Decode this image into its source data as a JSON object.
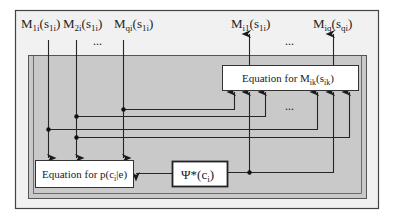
{
  "diagram": {
    "colors": {
      "outer_frame_fill": "#f1f1f1",
      "inner_region_fill": "#c9c9c9",
      "line": "#262626",
      "box_fill": "#ffffff"
    },
    "inputs": [
      {
        "main": "M",
        "sub": "1i",
        "arg_main": "s",
        "arg_sub": "1i"
      },
      {
        "main": "M",
        "sub": "2i",
        "arg_main": "s",
        "arg_sub": "1i"
      },
      {
        "main": "M",
        "sub": "qi",
        "arg_main": "s",
        "arg_sub": "1i"
      }
    ],
    "inputs_ellipsis": "...",
    "outputs": [
      {
        "main": "M",
        "sub": "i1",
        "arg_main": "s",
        "arg_sub": "1i"
      },
      {
        "main": "M",
        "sub": "iq",
        "arg_main": "s",
        "arg_sub": "qi"
      }
    ],
    "outputs_ellipsis": "...",
    "arrows_ellipsis": "...",
    "box_m": {
      "prefix": "Equation for ",
      "main": "M",
      "sub": "ik",
      "arg_main": "s",
      "arg_sub": "ik"
    },
    "box_p": {
      "prefix": "Equation for ",
      "text": "p(c",
      "sub": "i",
      "suffix": "|e)"
    },
    "box_psi": {
      "main": "Ψ*(c",
      "sub": "i",
      "suffix": ")"
    }
  }
}
